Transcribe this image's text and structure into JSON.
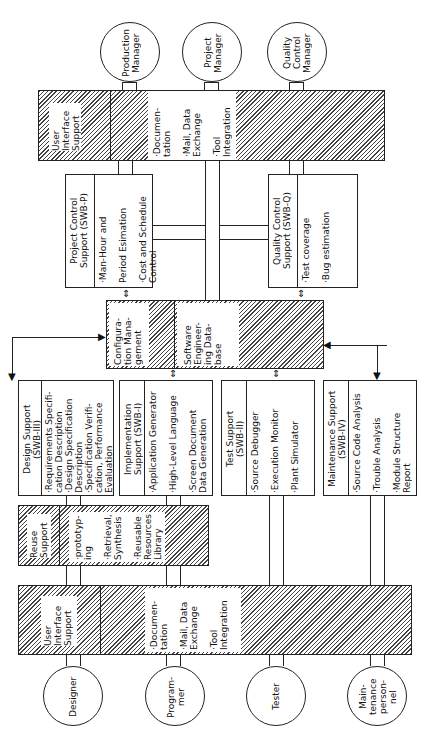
{
  "managers": [
    {
      "label": "Production\nManager"
    },
    {
      "label": "Project\nManager"
    },
    {
      "label": "Quality\nControl\nManager"
    }
  ],
  "users": [
    {
      "label": "Designer"
    },
    {
      "label": "Program-\nmer"
    },
    {
      "label": "Tester"
    },
    {
      "label": "Main-\ntenance\nperson-\nnel"
    }
  ],
  "top_ui": {
    "title": "User\nInterface\nSupport",
    "items": "·Documen-\ntation\n\n·Mail, Data\nExchange\n\n·Tool\nIntegration"
  },
  "bottom_ui": {
    "title": "User\nInterface\nSupport",
    "items": "·Documen-\ntation\n\n·Mail, Data\nExchange\n\n·Tool\nIntegration"
  },
  "project_control": {
    "title": "Project Control\nSupport (SWB-P)",
    "items": "·Man-Hour and\n\nPeriod Esimation\n\n·Cost and Schedule\nControl"
  },
  "quality_control": {
    "title": "Quality Control\nSupport (SWB-Q)",
    "items": "·Test coverage\n\n·Bug estimation"
  },
  "center": {
    "config": "Configura-\ntion Mana-\ngement",
    "database": "Software\nEngineer-\ning Data-\nbase"
  },
  "design_support": {
    "title": "Design Support\n(SWB-III)",
    "items": "·Requirements Specifi-\ncation Description\n·Design Specification\nDescription\n·Specification Verifi-\ncation, Performance\nEvaluation"
  },
  "implementation_support": {
    "title": "Implementation\nSupport (SWB-I)",
    "items": "·Application Generator\n\n·High-Level Language\n\n·Screen Document\nData Generation"
  },
  "test_support": {
    "title": "Test Support\n(SWB-II)",
    "items": "·Source Debugger\n\n·Execution Monitor\n\n·Plant Simulator"
  },
  "maintenance_support": {
    "title": "Maintenance Support\n(SWB-IV)",
    "items": "·Source Code Analysis\n\n·Trouble Analysis\n\n·Module Structure\nReport"
  },
  "reuse_support": {
    "title": "Reuse\nSupport",
    "items": "·prototyp-\ning\n\n·Retrieval,\nSynthesis\n\n·Reusable\nResources\nLibrary"
  },
  "arrows": {
    "double": "⇕",
    "down": "▼",
    "right": "▶",
    "left": "◀"
  }
}
